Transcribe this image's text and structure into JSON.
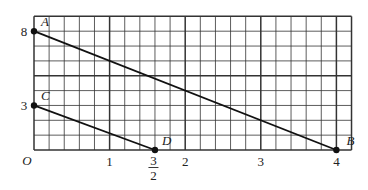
{
  "chart_data": {
    "type": "line",
    "title": "",
    "xlabel": "",
    "ylabel": "",
    "origin_label": "O",
    "xlim": [
      0,
      4.2
    ],
    "ylim": [
      0,
      9
    ],
    "grid": {
      "on": true,
      "minor_step_x": 0.2,
      "minor_step_y": 1,
      "major_x": [
        1,
        2,
        3,
        4
      ],
      "major_y": [
        5
      ]
    },
    "x_tick_labels": [
      {
        "value": 1,
        "text": "1"
      },
      {
        "value": 2,
        "text": "2"
      },
      {
        "value": 3,
        "text": "3"
      },
      {
        "value": 4,
        "text": "4"
      }
    ],
    "x_fraction_label": {
      "value": 1.6,
      "numerator": "3",
      "denominator": "2"
    },
    "y_tick_labels": [
      {
        "value": 8,
        "text": "8"
      },
      {
        "value": 3,
        "text": "3"
      }
    ],
    "points": [
      {
        "name": "A",
        "x": 0,
        "y": 8,
        "drawn_x": 0
      },
      {
        "name": "B",
        "x": 4,
        "y": 0,
        "drawn_x": 4
      },
      {
        "name": "C",
        "x": 0,
        "y": 3,
        "drawn_x": 0
      },
      {
        "name": "D",
        "x": 1.5,
        "y": 0,
        "drawn_x": 1.6
      }
    ],
    "series": [
      {
        "name": "AB",
        "from": "A",
        "to": "B"
      },
      {
        "name": "CD",
        "from": "C",
        "to": "D"
      }
    ]
  },
  "colors": {
    "grid": "#333333",
    "line": "#111111",
    "background": "#ffffff"
  }
}
